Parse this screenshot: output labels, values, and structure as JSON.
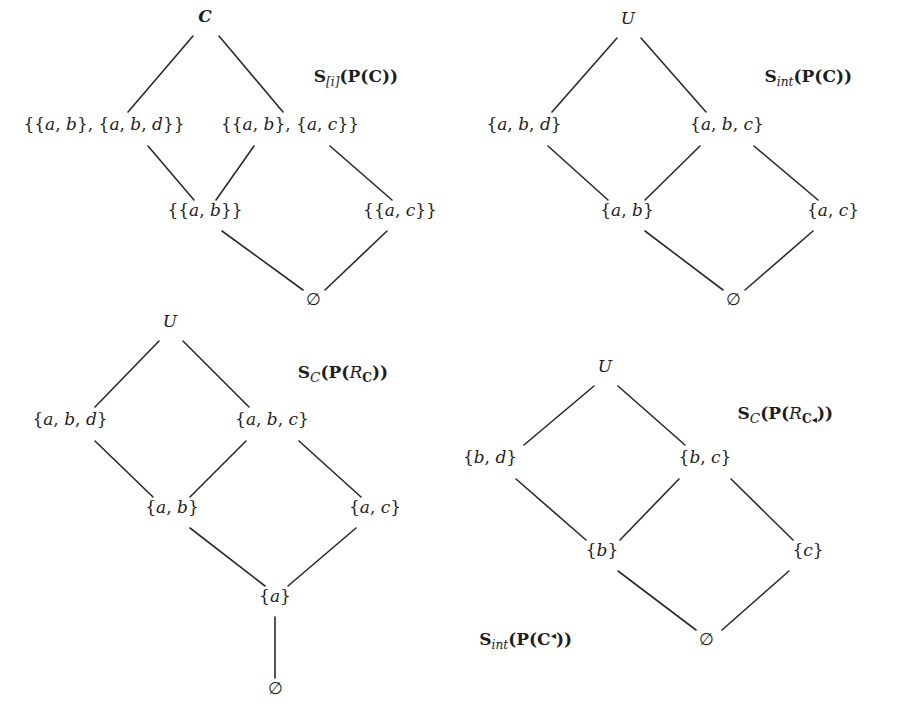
{
  "figure": {
    "width": 909,
    "height": 717,
    "line_color": "#2a2a2a",
    "text_color": "#1d1d1d",
    "background": "#ffffff"
  },
  "panels": [
    {
      "id": "panel-top-left",
      "labels": [
        {
          "id": "label-s-i-pc",
          "text": "S[i](P(C))",
          "parts": [
            {
              "t": "S",
              "style": "bold-upright"
            },
            {
              "t": "[i]",
              "style": "italic-subscript"
            },
            {
              "t": "(",
              "style": "bold-upright"
            },
            {
              "t": "P",
              "style": "bold-upright"
            },
            {
              "t": "(",
              "style": "bold-upright"
            },
            {
              "t": "C",
              "style": "bold-upright"
            },
            {
              "t": "))",
              "style": "bold-upright"
            }
          ],
          "x": 398,
          "y": 82
        }
      ],
      "nodes": [
        {
          "id": "n-tl-top",
          "text": "C",
          "style": "bold-upright",
          "x": 205,
          "y": 22,
          "anchor": "middle"
        },
        {
          "id": "n-tl-l2a",
          "text": "{{a, b}, {a, b, d}}",
          "style": "math",
          "x": 104,
          "y": 130,
          "anchor": "middle"
        },
        {
          "id": "n-tl-l2b",
          "text": "{{a, b}, {a, c}}",
          "style": "math",
          "x": 290,
          "y": 130,
          "anchor": "middle"
        },
        {
          "id": "n-tl-l3a",
          "text": "{{a, b}}",
          "style": "math",
          "x": 205,
          "y": 216,
          "anchor": "middle"
        },
        {
          "id": "n-tl-l3b",
          "text": "{{a, c}}",
          "style": "math",
          "x": 400,
          "y": 216,
          "anchor": "middle"
        },
        {
          "id": "n-tl-bottom",
          "text": "∅",
          "style": "math",
          "x": 313,
          "y": 305,
          "anchor": "middle"
        }
      ],
      "edges": [
        {
          "from": "n-tl-top",
          "to": "n-tl-l2a",
          "x1": 193,
          "y1": 36,
          "x2": 128,
          "y2": 112
        },
        {
          "from": "n-tl-top",
          "to": "n-tl-l2b",
          "x1": 219,
          "y1": 36,
          "x2": 283,
          "y2": 112
        },
        {
          "from": "n-tl-l2a",
          "to": "n-tl-l3a",
          "x1": 148,
          "y1": 146,
          "x2": 194,
          "y2": 200
        },
        {
          "from": "n-tl-l2b",
          "to": "n-tl-l3a",
          "x1": 254,
          "y1": 146,
          "x2": 216,
          "y2": 200
        },
        {
          "from": "n-tl-l2b",
          "to": "n-tl-l3b",
          "x1": 330,
          "y1": 146,
          "x2": 392,
          "y2": 200
        },
        {
          "from": "n-tl-l3a",
          "to": "n-tl-bottom",
          "x1": 222,
          "y1": 231,
          "x2": 303,
          "y2": 290
        },
        {
          "from": "n-tl-l3b",
          "to": "n-tl-bottom",
          "x1": 387,
          "y1": 231,
          "x2": 325,
          "y2": 290
        }
      ]
    },
    {
      "id": "panel-top-right",
      "labels": [
        {
          "id": "label-s-int-pc",
          "text": "Sint(P(C))",
          "parts": [
            {
              "t": "S",
              "style": "bold-upright"
            },
            {
              "t": "int",
              "style": "italic-subscript"
            },
            {
              "t": "(",
              "style": "bold-upright"
            },
            {
              "t": "P",
              "style": "bold-upright"
            },
            {
              "t": "(",
              "style": "bold-upright"
            },
            {
              "t": "C",
              "style": "bold-upright"
            },
            {
              "t": "))",
              "style": "bold-upright"
            }
          ],
          "x": 852,
          "y": 82
        }
      ],
      "nodes": [
        {
          "id": "n-tr-top",
          "text": "U",
          "style": "italic",
          "x": 628,
          "y": 24,
          "anchor": "middle"
        },
        {
          "id": "n-tr-l2a",
          "text": "{a, b, d}",
          "style": "math",
          "x": 524,
          "y": 130,
          "anchor": "middle"
        },
        {
          "id": "n-tr-l2b",
          "text": "{a, b, c}",
          "style": "math",
          "x": 727,
          "y": 130,
          "anchor": "middle"
        },
        {
          "id": "n-tr-l3a",
          "text": "{a, b}",
          "style": "math",
          "x": 627,
          "y": 216,
          "anchor": "middle"
        },
        {
          "id": "n-tr-l3b",
          "text": "{a, c}",
          "style": "math",
          "x": 833,
          "y": 216,
          "anchor": "middle"
        },
        {
          "id": "n-tr-bottom",
          "text": "∅",
          "style": "math",
          "x": 733,
          "y": 305,
          "anchor": "middle"
        }
      ],
      "edges": [
        {
          "from": "n-tr-top",
          "to": "n-tr-l2a",
          "x1": 617,
          "y1": 38,
          "x2": 552,
          "y2": 112
        },
        {
          "from": "n-tr-top",
          "to": "n-tr-l2b",
          "x1": 641,
          "y1": 38,
          "x2": 706,
          "y2": 112
        },
        {
          "from": "n-tr-l2a",
          "to": "n-tr-l3a",
          "x1": 548,
          "y1": 146,
          "x2": 608,
          "y2": 200
        },
        {
          "from": "n-tr-l2b",
          "to": "n-tr-l3a",
          "x1": 700,
          "y1": 146,
          "x2": 645,
          "y2": 200
        },
        {
          "from": "n-tr-l2b",
          "to": "n-tr-l3b",
          "x1": 754,
          "y1": 146,
          "x2": 818,
          "y2": 200
        },
        {
          "from": "n-tr-l3a",
          "to": "n-tr-bottom",
          "x1": 645,
          "y1": 231,
          "x2": 723,
          "y2": 290
        },
        {
          "from": "n-tr-l3b",
          "to": "n-tr-bottom",
          "x1": 813,
          "y1": 231,
          "x2": 745,
          "y2": 290
        }
      ]
    },
    {
      "id": "panel-bottom-left",
      "labels": [
        {
          "id": "label-s-c-prc",
          "text": "SC(P(RC))",
          "parts": [
            {
              "t": "S",
              "style": "bold-upright"
            },
            {
              "t": "C",
              "style": "calligraphic-subscript"
            },
            {
              "t": "(",
              "style": "bold-upright"
            },
            {
              "t": "P",
              "style": "bold-upright"
            },
            {
              "t": "(",
              "style": "bold-upright"
            },
            {
              "t": "R",
              "style": "italic"
            },
            {
              "t": "C",
              "style": "bold-subscript"
            },
            {
              "t": "))",
              "style": "bold-upright"
            }
          ],
          "x": 388,
          "y": 378
        }
      ],
      "nodes": [
        {
          "id": "n-bl-top",
          "text": "U",
          "style": "italic",
          "x": 170,
          "y": 327,
          "anchor": "middle"
        },
        {
          "id": "n-bl-l2a",
          "text": "{a, b, d}",
          "style": "math",
          "x": 70,
          "y": 425,
          "anchor": "middle"
        },
        {
          "id": "n-bl-l2b",
          "text": "{a, b, c}",
          "style": "math",
          "x": 272,
          "y": 425,
          "anchor": "middle"
        },
        {
          "id": "n-bl-l3a",
          "text": "{a, b}",
          "style": "math",
          "x": 172,
          "y": 513,
          "anchor": "middle"
        },
        {
          "id": "n-bl-l3b",
          "text": "{a, c}",
          "style": "math",
          "x": 375,
          "y": 513,
          "anchor": "middle"
        },
        {
          "id": "n-bl-l4",
          "text": "{a}",
          "style": "math",
          "x": 275,
          "y": 602,
          "anchor": "middle"
        },
        {
          "id": "n-bl-bottom",
          "text": "∅",
          "style": "math",
          "x": 275,
          "y": 694,
          "anchor": "middle"
        }
      ],
      "edges": [
        {
          "from": "n-bl-top",
          "to": "n-bl-l2a",
          "x1": 159,
          "y1": 341,
          "x2": 95,
          "y2": 407
        },
        {
          "from": "n-bl-top",
          "to": "n-bl-l2b",
          "x1": 183,
          "y1": 341,
          "x2": 249,
          "y2": 407
        },
        {
          "from": "n-bl-l2a",
          "to": "n-bl-l3a",
          "x1": 95,
          "y1": 441,
          "x2": 153,
          "y2": 497
        },
        {
          "from": "n-bl-l2b",
          "to": "n-bl-l3a",
          "x1": 246,
          "y1": 441,
          "x2": 190,
          "y2": 497
        },
        {
          "from": "n-bl-l2b",
          "to": "n-bl-l3b",
          "x1": 299,
          "y1": 441,
          "x2": 361,
          "y2": 497
        },
        {
          "from": "n-bl-l3a",
          "to": "n-bl-l4",
          "x1": 190,
          "y1": 528,
          "x2": 265,
          "y2": 586
        },
        {
          "from": "n-bl-l3b",
          "to": "n-bl-l4",
          "x1": 356,
          "y1": 528,
          "x2": 288,
          "y2": 586
        },
        {
          "from": "n-bl-l4",
          "to": "n-bl-bottom",
          "x1": 275,
          "y1": 617,
          "x2": 275,
          "y2": 678
        }
      ]
    },
    {
      "id": "panel-bottom-right",
      "labels": [
        {
          "id": "label-s-c-prctri",
          "text": "SC(P(RC◂))",
          "parts": [
            {
              "t": "S",
              "style": "bold-upright"
            },
            {
              "t": "C",
              "style": "calligraphic-subscript"
            },
            {
              "t": "(",
              "style": "bold-upright"
            },
            {
              "t": "P",
              "style": "bold-upright"
            },
            {
              "t": "(",
              "style": "bold-upright"
            },
            {
              "t": "R",
              "style": "italic"
            },
            {
              "t": "C",
              "style": "bold-subscript"
            },
            {
              "t": "◂",
              "style": "triangle-subscript"
            },
            {
              "t": "))",
              "style": "bold-upright"
            }
          ],
          "x": 833,
          "y": 419
        },
        {
          "id": "label-s-int-pctri",
          "text": "Sint(P(C◂))",
          "parts": [
            {
              "t": "S",
              "style": "bold-upright"
            },
            {
              "t": "int",
              "style": "italic-subscript"
            },
            {
              "t": "(",
              "style": "bold-upright"
            },
            {
              "t": "P",
              "style": "bold-upright"
            },
            {
              "t": "(",
              "style": "bold-upright"
            },
            {
              "t": "C",
              "style": "bold-upright"
            },
            {
              "t": "◂",
              "style": "triangle-superscript"
            },
            {
              "t": "))",
              "style": "bold-upright"
            }
          ],
          "x": 572,
          "y": 645
        }
      ],
      "nodes": [
        {
          "id": "n-br-top",
          "text": "U",
          "style": "italic",
          "x": 605,
          "y": 372,
          "anchor": "middle"
        },
        {
          "id": "n-br-l2a",
          "text": "{b, d}",
          "style": "math",
          "x": 490,
          "y": 463,
          "anchor": "middle"
        },
        {
          "id": "n-br-l2b",
          "text": "{b, c}",
          "style": "math",
          "x": 705,
          "y": 463,
          "anchor": "middle"
        },
        {
          "id": "n-br-l3a",
          "text": "{b}",
          "style": "math",
          "x": 602,
          "y": 556,
          "anchor": "middle"
        },
        {
          "id": "n-br-l3b",
          "text": "{c}",
          "style": "math",
          "x": 808,
          "y": 556,
          "anchor": "middle"
        },
        {
          "id": "n-br-bottom",
          "text": "∅",
          "style": "math",
          "x": 706,
          "y": 645,
          "anchor": "middle"
        }
      ],
      "edges": [
        {
          "from": "n-br-top",
          "to": "n-br-l2a",
          "x1": 594,
          "y1": 386,
          "x2": 524,
          "y2": 445
        },
        {
          "from": "n-br-top",
          "to": "n-br-l2b",
          "x1": 618,
          "y1": 386,
          "x2": 685,
          "y2": 445
        },
        {
          "from": "n-br-l2a",
          "to": "n-br-l3a",
          "x1": 516,
          "y1": 479,
          "x2": 586,
          "y2": 540
        },
        {
          "from": "n-br-l2b",
          "to": "n-br-l3a",
          "x1": 679,
          "y1": 479,
          "x2": 620,
          "y2": 540
        },
        {
          "from": "n-br-l2b",
          "to": "n-br-l3b",
          "x1": 731,
          "y1": 479,
          "x2": 793,
          "y2": 540
        },
        {
          "from": "n-br-l3a",
          "to": "n-br-bottom",
          "x1": 618,
          "y1": 571,
          "x2": 696,
          "y2": 630
        },
        {
          "from": "n-br-l3b",
          "to": "n-br-bottom",
          "x1": 789,
          "y1": 571,
          "x2": 722,
          "y2": 630
        }
      ]
    }
  ]
}
